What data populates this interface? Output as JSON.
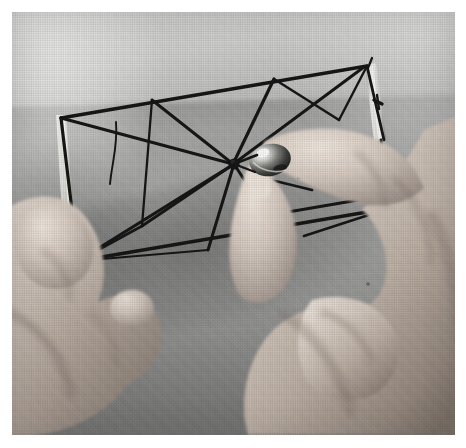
{
  "image": {
    "kind": "photograph",
    "medium": "halftone-printed black-and-white photograph",
    "caption": "Two hands hold a rectangular frame strung with threads that all converge on a single central knot; the right hand pinches a small shiny metal bead at that centre point.",
    "orientation": "landscape",
    "plate": {
      "left_px": 12,
      "top_px": 12,
      "width_px": 443,
      "height_px": 423,
      "border_color": "#ffffff"
    },
    "palette": {
      "paper_white": "#ffffff",
      "background_light": "#d8d8d7",
      "background_mid": "#b0b0af",
      "background_dark": "#8a8a89",
      "string_black": "#171717",
      "frame_light": "#e6e6e3",
      "skin_light": "#d9cfc6",
      "skin_mid": "#b8aaa0",
      "skin_shadow": "#7d7269",
      "bead_highlight": "#f4f4f2",
      "bead_dark": "#3a3a39"
    }
  },
  "scene": {
    "subjects": [
      {
        "id": "frame",
        "label": "Rectangular strung frame",
        "description": "A thin rectangular frame, tilted about 13 degrees, spanning the upper-left two thirds of the picture. Pale wooden or metal rails catch the light along the left and right short edges.",
        "tilt_degrees": -13
      },
      {
        "id": "string-network",
        "label": "Converging thread network",
        "description": "Roughly ten dark threads are stretched between points on the frame rails and all pass through or tie to one common knot near the middle-right of the frame.",
        "thread_count": 10,
        "hub_label": "central knot"
      },
      {
        "id": "bead",
        "label": "Shiny metal bead",
        "description": "A small specular metal bead or ring sitting at the central knot, pinched between the thumb and index finger of the right hand."
      },
      {
        "id": "left-hand",
        "label": "Left hand",
        "description": "Enters from the lower-left, fingers curled, thumb bracing the bottom-left corner rail of the frame from below."
      },
      {
        "id": "right-hand",
        "label": "Right hand",
        "description": "Enters from the right edge, thumb and forefinger pinching the bead at the hub; remaining fingers curl beneath the frame."
      },
      {
        "id": "background",
        "label": "Plain backdrop",
        "description": "An undifferentiated light grey wall above and a slightly darker grey cloth or paper surface below, with a soft cast shadow beneath the frame."
      }
    ]
  },
  "labels": {
    "figure_title": ""
  }
}
